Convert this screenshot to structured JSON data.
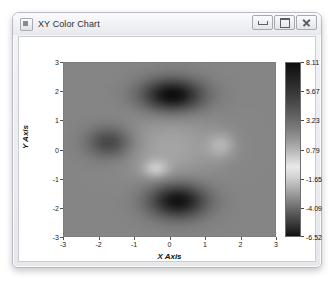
{
  "window": {
    "title": "XY Color Chart",
    "icon": "application-icon",
    "controls": [
      {
        "name": "minimize-button",
        "glyph": "minimize-icon",
        "label": "Minimize"
      },
      {
        "name": "maximize-button",
        "glyph": "maximize-icon",
        "label": "Maximize"
      },
      {
        "name": "close-button",
        "glyph": "close-icon",
        "label": "Close"
      }
    ]
  },
  "chart_data": {
    "type": "heatmap",
    "title": "",
    "xlabel": "X Axis",
    "ylabel": "Y Axis",
    "xlim": [
      -3,
      3
    ],
    "ylim": [
      -3,
      3
    ],
    "xticks": [
      "-3",
      "-2",
      "-1",
      "0",
      "1",
      "2",
      "3"
    ],
    "yticks": [
      "3",
      "2",
      "1",
      "0",
      "-1",
      "-2",
      "-3"
    ],
    "xtick_values": [
      -3,
      -2,
      -1,
      0,
      1,
      2,
      3
    ],
    "ytick_values": [
      3,
      2,
      1,
      0,
      -1,
      -2,
      -3
    ],
    "grid": false,
    "colormap": "gray",
    "zlim": [
      -6.52,
      8.11
    ],
    "colorbar": {
      "position": "right",
      "ticks": [
        "8.11",
        "5.67",
        "3.23",
        "0.79",
        "-1.65",
        "-4.09",
        "-6.52"
      ],
      "tick_values": [
        8.11,
        5.67,
        3.23,
        0.79,
        -1.65,
        -4.09,
        -6.52
      ]
    },
    "features": [
      {
        "name": "dark-blob-upper",
        "center": [
          0.0,
          1.9
        ],
        "value": 8.11
      },
      {
        "name": "dark-blob-lower",
        "center": [
          0.2,
          -1.7
        ],
        "value": 7.6
      },
      {
        "name": "mid-blob-left",
        "center": [
          -1.7,
          0.3
        ],
        "value": 4.2
      },
      {
        "name": "light-patch-right",
        "center": [
          1.4,
          0.2
        ],
        "value": -2.2
      },
      {
        "name": "light-patch-center",
        "center": [
          -0.4,
          -0.6
        ],
        "value": -3.4
      },
      {
        "name": "background-plateau",
        "center": [
          -2.6,
          2.6
        ],
        "value": 0.3
      }
    ]
  },
  "colors": {
    "window_frame": "#b9bcc2",
    "titlebar_top": "#fbfbfc",
    "client_background": "#ffffff",
    "axes_border": "#7c7c7c",
    "tick_text": "#1a1a1a",
    "colorbar_low": "#111111",
    "colorbar_high": "#0d0d0d",
    "colorbar_mid": "#e9e9e9"
  }
}
